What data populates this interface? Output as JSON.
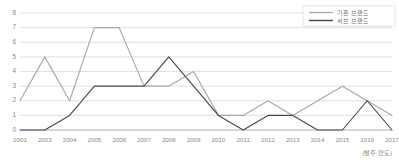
{
  "chart_data": {
    "type": "line",
    "title": "",
    "xlabel": "(발주 연도)",
    "ylabel": "",
    "categories": [
      "2001",
      "2003",
      "2004",
      "2005",
      "2006",
      "2007",
      "2008",
      "2009",
      "2010",
      "2011",
      "2012",
      "2013",
      "2014",
      "2015",
      "2016",
      "2017"
    ],
    "ylim": [
      0,
      8
    ],
    "yticks": [
      0,
      1,
      2,
      3,
      4,
      5,
      6,
      7,
      8
    ],
    "grid": true,
    "legend_position": "top-right",
    "series": [
      {
        "name": "기존 브랜드",
        "color": "#a8a8a8",
        "values": [
          2,
          5,
          2,
          7,
          7,
          3,
          3,
          4,
          1,
          1,
          2,
          1,
          2,
          3,
          2,
          1
        ]
      },
      {
        "name": "서브 브랜드",
        "color": "#4a4a4a",
        "values": [
          0,
          0,
          1,
          3,
          3,
          3,
          5,
          3,
          1,
          0,
          1,
          1,
          0,
          0,
          2,
          0
        ]
      }
    ]
  },
  "axis": {
    "y_labels": [
      "8",
      "7",
      "6",
      "5",
      "4",
      "3",
      "2",
      "1",
      "0"
    ],
    "x_caption": "(발주 연도)"
  },
  "legend": {
    "items": [
      {
        "label": "기존 브랜드"
      },
      {
        "label": "서브 브랜드"
      }
    ]
  }
}
